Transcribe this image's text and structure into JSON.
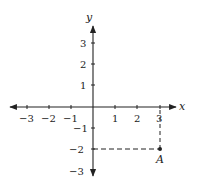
{
  "diagram": {
    "type": "coordinate-plane",
    "axes": {
      "x_label": "x",
      "y_label": "y",
      "x_ticks": [
        {
          "value": -3,
          "label": "−3"
        },
        {
          "value": -2,
          "label": "−2"
        },
        {
          "value": -1,
          "label": "−1"
        },
        {
          "value": 1,
          "label": "1"
        },
        {
          "value": 2,
          "label": "2"
        },
        {
          "value": 3,
          "label": "3"
        }
      ],
      "y_ticks": [
        {
          "value": 3,
          "label": "3"
        },
        {
          "value": 2,
          "label": "2"
        },
        {
          "value": 1,
          "label": "1"
        },
        {
          "value": -1,
          "label": "−1"
        },
        {
          "value": -2,
          "label": "−2"
        },
        {
          "value": -3,
          "label": "−3"
        }
      ]
    },
    "points": [
      {
        "name": "A",
        "x": 3,
        "y": -2,
        "label": "A"
      }
    ],
    "guides": [
      {
        "from": [
          3,
          0
        ],
        "to": [
          3,
          -2
        ],
        "style": "dashed"
      },
      {
        "from": [
          0,
          -2
        ],
        "to": [
          3,
          -2
        ],
        "style": "dashed"
      }
    ],
    "colors": {
      "ink": "#222222",
      "background": "#ffffff"
    }
  }
}
